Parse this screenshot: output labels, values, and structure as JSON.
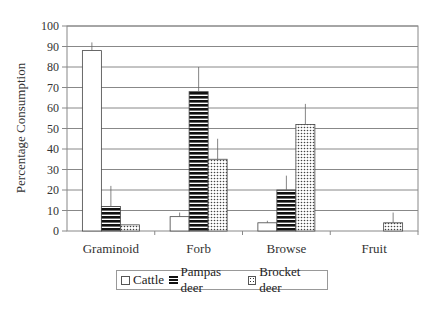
{
  "chart_data": {
    "type": "bar",
    "title": "",
    "xlabel": "",
    "ylabel": "Percentage Consumption",
    "ylim": [
      0,
      100
    ],
    "yticks": [
      0,
      10,
      20,
      30,
      40,
      50,
      60,
      70,
      80,
      90,
      100
    ],
    "grid": true,
    "legend_position": "bottom",
    "categories": [
      "Graminoid",
      "Forb",
      "Browse",
      "Fruit"
    ],
    "series": [
      {
        "name": "Cattle",
        "pattern": "white",
        "values": [
          88,
          7,
          4,
          0
        ],
        "error_upper": [
          92,
          9,
          5,
          0
        ]
      },
      {
        "name": "Pampas deer",
        "pattern": "horizontal-stripes",
        "values": [
          12,
          68,
          20,
          0
        ],
        "error_upper": [
          22,
          80,
          27,
          0
        ]
      },
      {
        "name": "Brocket deer",
        "pattern": "dots",
        "values": [
          3,
          35,
          52,
          4
        ],
        "error_upper": [
          3,
          45,
          62,
          9
        ]
      }
    ]
  },
  "legend": {
    "items": [
      {
        "label": "Cattle"
      },
      {
        "label": "Pampas deer"
      },
      {
        "label": "Brocket deer"
      }
    ]
  }
}
